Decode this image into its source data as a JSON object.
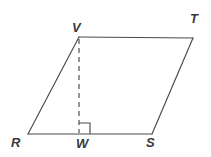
{
  "figure": {
    "type": "geometry-diagram",
    "shape": "parallelogram",
    "name": "parallelogram-RVTS-with-altitude-VW",
    "background_color": "#ffffff",
    "stroke_color": "#4a4a4c",
    "label_color": "#3a3a3c",
    "labels": {
      "V": "V",
      "T": "T",
      "R": "R",
      "W": "W",
      "S": "S"
    },
    "vertices": [
      {
        "id": "V",
        "label": "V",
        "x": 79,
        "y": 37
      },
      {
        "id": "T",
        "label": "T",
        "x": 193,
        "y": 38
      },
      {
        "id": "S",
        "label": "S",
        "x": 152,
        "y": 134
      },
      {
        "id": "R",
        "label": "R",
        "x": 28,
        "y": 134
      },
      {
        "id": "W",
        "label": "W",
        "x": 79,
        "y": 134
      }
    ],
    "solid_segments": [
      {
        "name": "side-VT",
        "from": "V",
        "to": "T",
        "x1": 79,
        "y1": 37,
        "x2": 193,
        "y2": 38
      },
      {
        "name": "side-TS",
        "from": "T",
        "to": "S",
        "x1": 193,
        "y1": 38,
        "x2": 152,
        "y2": 134
      },
      {
        "name": "side-SR",
        "from": "S",
        "to": "R",
        "x1": 152,
        "y1": 134,
        "x2": 28,
        "y2": 134
      },
      {
        "name": "side-RV",
        "from": "R",
        "to": "V",
        "x1": 28,
        "y1": 134,
        "x2": 79,
        "y2": 37
      }
    ],
    "dashed_segments": [
      {
        "name": "altitude-VW",
        "from": "V",
        "to": "W",
        "x1": 79,
        "y1": 39,
        "x2": 79,
        "y2": 133,
        "dash": "5 4"
      }
    ],
    "right_angle_marker": {
      "name": "right-angle-at-W",
      "at_vertex": "W",
      "x": 79,
      "y": 123,
      "size": 11
    }
  }
}
